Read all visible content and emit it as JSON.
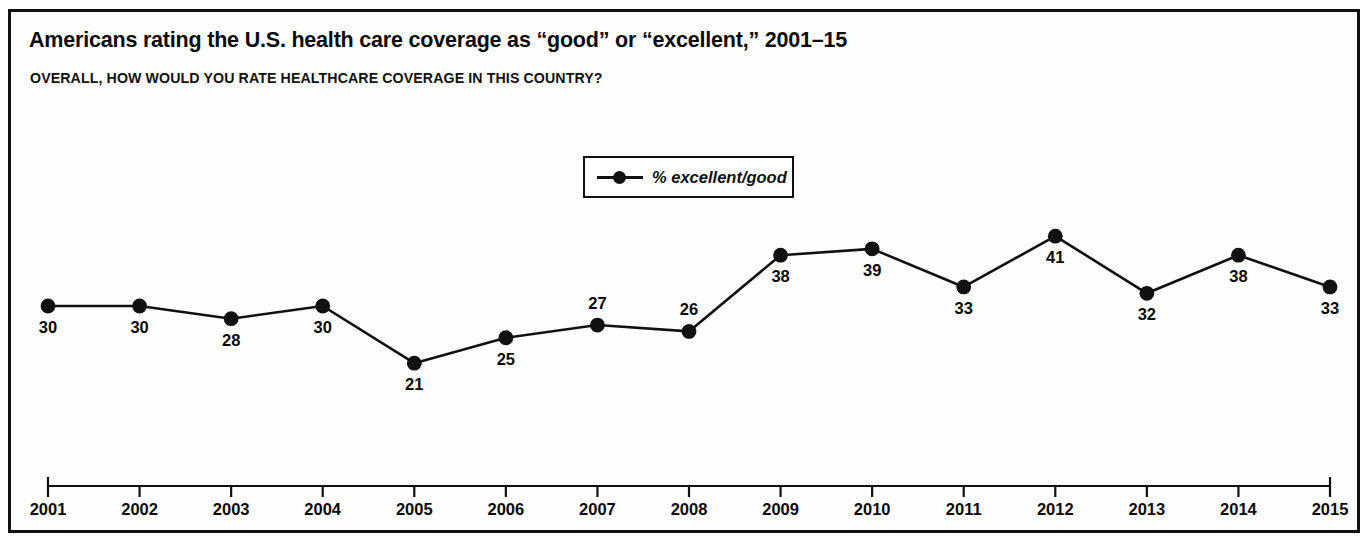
{
  "figure": {
    "title": "Americans rating the U.S. health care coverage as “good” or “excellent,” 2001–15",
    "subtitle": "OVERALL, HOW WOULD YOU RATE HEALTHCARE COVERAGE IN THIS COUNTRY?",
    "border_color": "#111111",
    "background_color": "#FEFEFE"
  },
  "legend": {
    "position": "top-center",
    "entries": [
      {
        "label": "% excellent/good",
        "marker": "line-circle",
        "color": "#111111"
      }
    ]
  },
  "chart_data": {
    "type": "line",
    "title": "Americans rating the U.S. health care coverage as “good” or “excellent,” 2001–15",
    "subtitle": "OVERALL, HOW WOULD YOU RATE HEALTHCARE COVERAGE IN THIS COUNTRY?",
    "xlabel": "",
    "ylabel": "",
    "grid": false,
    "legend_position": "top-center",
    "axis_visible": {
      "x": true,
      "y": false
    },
    "ylim": [
      18,
      44
    ],
    "categories": [
      "2001",
      "2002",
      "2003",
      "2004",
      "2005",
      "2006",
      "2007",
      "2008",
      "2009",
      "2010",
      "2011",
      "2012",
      "2013",
      "2014",
      "2015"
    ],
    "series": [
      {
        "name": "% excellent/good",
        "color": "#111111",
        "marker": "circle",
        "values": [
          30,
          30,
          28,
          30,
          21,
          25,
          27,
          26,
          38,
          39,
          33,
          41,
          32,
          38,
          33
        ],
        "data_labels": [
          "30",
          "30",
          "28",
          "30",
          "21",
          "25",
          "27",
          "26",
          "38",
          "39",
          "33",
          "41",
          "32",
          "38",
          "33"
        ],
        "label_positions": [
          "below",
          "below",
          "below",
          "below",
          "below",
          "below",
          "above",
          "above",
          "below",
          "below",
          "below",
          "below",
          "below",
          "below",
          "below"
        ]
      }
    ]
  },
  "axis": {
    "x_tick_labels": [
      "2001",
      "2002",
      "2003",
      "2004",
      "2005",
      "2006",
      "2007",
      "2008",
      "2009",
      "2010",
      "2011",
      "2012",
      "2013",
      "2014",
      "2015"
    ]
  },
  "footnote": {
    "text": ""
  }
}
